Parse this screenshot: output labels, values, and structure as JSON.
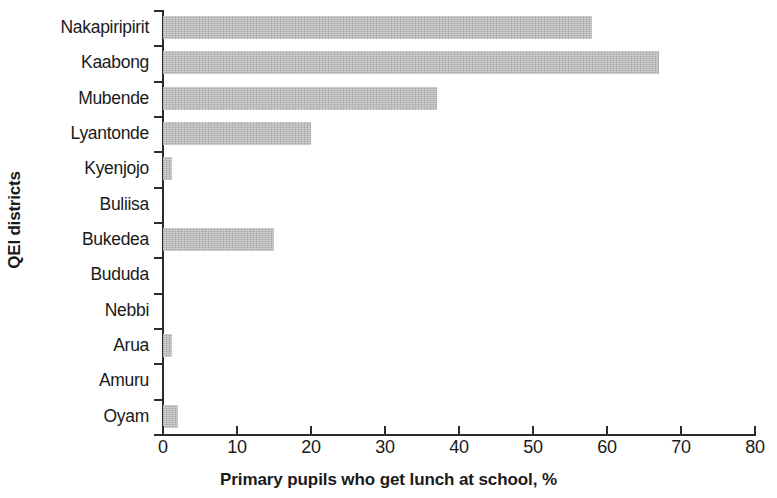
{
  "chart_data": {
    "type": "bar",
    "orientation": "horizontal",
    "title": "",
    "xlabel": "Primary pupils who get lunch at school, %",
    "ylabel": "QEI districts",
    "categories": [
      "Nakapiripirit",
      "Kaabong",
      "Mubende",
      "Lyantonde",
      "Kyenjojo",
      "Buliisa",
      "Bukedea",
      "Bududa",
      "Nebbi",
      "Arua",
      "Amuru",
      "Oyam"
    ],
    "values": [
      58,
      67,
      37,
      20,
      1.2,
      0,
      15,
      0,
      0,
      1.2,
      0,
      2
    ],
    "xlim": [
      0,
      80
    ],
    "xticks": [
      0,
      10,
      20,
      30,
      40,
      50,
      60,
      70,
      80
    ],
    "xtick_labels": [
      "0",
      "10",
      "20",
      "30",
      "40",
      "50",
      "60",
      "70",
      "80"
    ],
    "grid": false,
    "legend": false,
    "bar_color": "#b2b2b2",
    "axis_color": "#2b2b2b"
  }
}
